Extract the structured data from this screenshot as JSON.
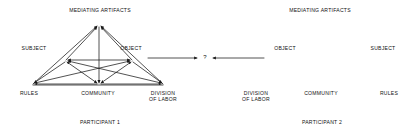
{
  "figure": {
    "type": "diagram",
    "background_color": "#ffffff",
    "line_color": "#1a1a1a",
    "text_color": "#111111",
    "connector": {
      "question_mark": "?",
      "left_arrow_label": "",
      "right_arrow_label": ""
    }
  },
  "diagrams": [
    {
      "id": "participant-1",
      "caption": "PARTICIPANT 1",
      "mirrored": false,
      "nodes": {
        "apex": "MEDIATING ARTIFACTS",
        "left_mid": "SUBJECT",
        "right_mid": "OBJECT",
        "bottom_left": "RULES",
        "bottom_center": "COMMUNITY",
        "bottom_right_line1": "DIVISION",
        "bottom_right_line2": "OF LABOR"
      }
    },
    {
      "id": "participant-2",
      "caption": "PARTICIPANT 2",
      "mirrored": true,
      "nodes": {
        "apex": "MEDIATING ARTIFACTS",
        "left_mid": "OBJECT",
        "right_mid": "SUBJECT",
        "bottom_left_line1": "DIVISION",
        "bottom_left_line2": "OF LABOR",
        "bottom_center": "COMMUNITY",
        "bottom_right": "RULES"
      }
    }
  ]
}
